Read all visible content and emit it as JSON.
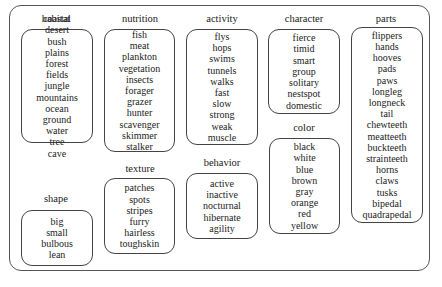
{
  "groups": {
    "habitat": {
      "title": "habitat",
      "items": [
        "coastal",
        "desert",
        "bush",
        "plains",
        "forest",
        "fields",
        "jungle",
        "mountains",
        "ocean",
        "ground",
        "water",
        "tree",
        "cave"
      ]
    },
    "shape": {
      "title": "shape",
      "items": [
        "big",
        "small",
        "bulbous",
        "lean"
      ]
    },
    "nutrition": {
      "title": "nutrition",
      "items": [
        "fish",
        "meat",
        "plankton",
        "vegetation",
        "insects",
        "forager",
        "grazer",
        "hunter",
        "scavenger",
        "skimmer",
        "stalker"
      ]
    },
    "texture": {
      "title": "texture",
      "items": [
        "patches",
        "spots",
        "stripes",
        "furry",
        "hairless",
        "toughskin"
      ]
    },
    "activity": {
      "title": "activity",
      "items": [
        "flys",
        "hops",
        "swims",
        "tunnels",
        "walks",
        "fast",
        "slow",
        "strong",
        "weak",
        "muscle"
      ]
    },
    "behavior": {
      "title": "behavior",
      "items": [
        "active",
        "inactive",
        "nocturnal",
        "hibernate",
        "agility"
      ]
    },
    "character": {
      "title": "character",
      "items": [
        "fierce",
        "timid",
        "smart",
        "group",
        "solitary",
        "nestspot",
        "domestic"
      ]
    },
    "color": {
      "title": "color",
      "items": [
        "black",
        "white",
        "blue",
        "brown",
        "gray",
        "orange",
        "red",
        "yellow"
      ]
    },
    "parts": {
      "title": "parts",
      "items": [
        "flippers",
        "hands",
        "hooves",
        "pads",
        "paws",
        "longleg",
        "longneck",
        "tail",
        "chewteeth",
        "meatteeth",
        "buckteeth",
        "strainteeth",
        "horns",
        "claws",
        "tusks",
        "bipedal",
        "quadrapedal"
      ]
    }
  }
}
